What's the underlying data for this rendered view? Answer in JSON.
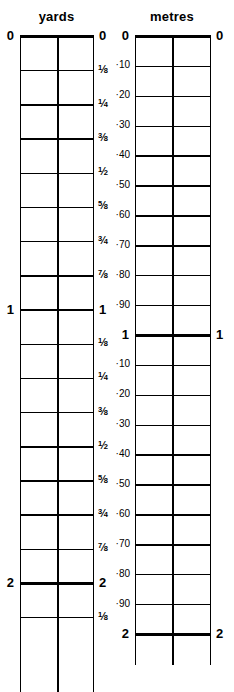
{
  "figure": {
    "name": "yards-metres-conversion-ruler",
    "width": 234,
    "height": 692,
    "background_color": "#ffffff",
    "line_color": "#000000",
    "text_color": "#000000"
  },
  "scales": [
    {
      "id": "yards",
      "title": "yards",
      "box": {
        "left": 20,
        "right": 93,
        "top": 36,
        "bottom": 692,
        "center_divider_x": 57
      },
      "unit_length_px": 273.5,
      "subdivision": "eighths",
      "ticks": [
        {
          "label": "0",
          "kind": "major",
          "value": 0.0,
          "y": 36.0
        },
        {
          "label": "1/8",
          "kind": "minor",
          "value": 0.125,
          "y": 70.2
        },
        {
          "label": "1/4",
          "kind": "minor",
          "value": 0.25,
          "y": 104.4
        },
        {
          "label": "3/8",
          "kind": "minor",
          "value": 0.375,
          "y": 138.6
        },
        {
          "label": "1/2",
          "kind": "minor",
          "value": 0.5,
          "y": 172.8
        },
        {
          "label": "5/8",
          "kind": "minor",
          "value": 0.625,
          "y": 206.9
        },
        {
          "label": "3/4",
          "kind": "minor",
          "value": 0.75,
          "y": 241.1
        },
        {
          "label": "7/8",
          "kind": "minor",
          "value": 0.875,
          "y": 275.3
        },
        {
          "label": "1",
          "kind": "major",
          "value": 1.0,
          "y": 309.5
        },
        {
          "label": "1/8",
          "kind": "minor",
          "value": 1.125,
          "y": 343.7
        },
        {
          "label": "1/4",
          "kind": "minor",
          "value": 1.25,
          "y": 377.9
        },
        {
          "label": "3/8",
          "kind": "minor",
          "value": 1.375,
          "y": 412.1
        },
        {
          "label": "1/2",
          "kind": "minor",
          "value": 1.5,
          "y": 446.3
        },
        {
          "label": "5/8",
          "kind": "minor",
          "value": 1.625,
          "y": 480.4
        },
        {
          "label": "3/4",
          "kind": "minor",
          "value": 1.75,
          "y": 514.6
        },
        {
          "label": "7/8",
          "kind": "minor",
          "value": 1.875,
          "y": 548.8
        },
        {
          "label": "2",
          "kind": "major",
          "value": 2.0,
          "y": 583.0
        },
        {
          "label": "1/8",
          "kind": "minor",
          "value": 2.125,
          "y": 617.2
        }
      ]
    },
    {
      "id": "metres",
      "title": "metres",
      "box": {
        "left": 135,
        "right": 210,
        "top": 36,
        "bottom": 665,
        "center_divider_x": 172
      },
      "unit_length_px": 299.0,
      "subdivision": "tenths",
      "ticks": [
        {
          "label": "0",
          "kind": "major",
          "value": 0.0,
          "y": 36.0
        },
        {
          "label": "·10",
          "kind": "minor",
          "value": 0.1,
          "y": 65.9
        },
        {
          "label": "·20",
          "kind": "minor",
          "value": 0.2,
          "y": 95.8
        },
        {
          "label": "·30",
          "kind": "minor",
          "value": 0.3,
          "y": 125.7
        },
        {
          "label": "·40",
          "kind": "minor",
          "value": 0.4,
          "y": 155.6
        },
        {
          "label": "·50",
          "kind": "minor",
          "value": 0.5,
          "y": 185.5
        },
        {
          "label": "·60",
          "kind": "minor",
          "value": 0.6,
          "y": 215.4
        },
        {
          "label": "·70",
          "kind": "minor",
          "value": 0.7,
          "y": 245.3
        },
        {
          "label": "·80",
          "kind": "minor",
          "value": 0.8,
          "y": 275.2
        },
        {
          "label": "·90",
          "kind": "minor",
          "value": 0.9,
          "y": 305.1
        },
        {
          "label": "1",
          "kind": "major",
          "value": 1.0,
          "y": 335.0
        },
        {
          "label": "·10",
          "kind": "minor",
          "value": 1.1,
          "y": 364.9
        },
        {
          "label": "·20",
          "kind": "minor",
          "value": 1.2,
          "y": 394.8
        },
        {
          "label": "·30",
          "kind": "minor",
          "value": 1.3,
          "y": 424.7
        },
        {
          "label": "·40",
          "kind": "minor",
          "value": 1.4,
          "y": 454.6
        },
        {
          "label": "·50",
          "kind": "minor",
          "value": 1.5,
          "y": 484.5
        },
        {
          "label": "·60",
          "kind": "minor",
          "value": 1.6,
          "y": 514.4
        },
        {
          "label": "·70",
          "kind": "minor",
          "value": 1.7,
          "y": 544.3
        },
        {
          "label": "·80",
          "kind": "minor",
          "value": 1.8,
          "y": 574.2
        },
        {
          "label": "·90",
          "kind": "minor",
          "value": 1.9,
          "y": 604.1
        },
        {
          "label": "2",
          "kind": "major",
          "value": 2.0,
          "y": 634.0
        }
      ]
    }
  ]
}
